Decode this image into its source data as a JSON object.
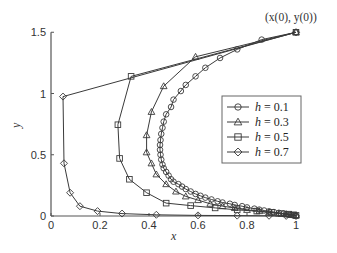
{
  "chart_data": {
    "type": "line",
    "title": "",
    "xlabel": "x",
    "ylabel": "y",
    "xlim": [
      0,
      1
    ],
    "ylim": [
      0,
      1.5
    ],
    "xticks": [
      0,
      0.2,
      0.4,
      0.6,
      0.8,
      1
    ],
    "xtick_labels": [
      "0",
      "0.2",
      "0.4",
      "0.6",
      "0.8",
      "1"
    ],
    "yticks": [
      0,
      0.5,
      1,
      1.5
    ],
    "ytick_labels": [
      "0",
      "0.5",
      "1",
      "1.5"
    ],
    "grid": false,
    "legend_position": "center-right",
    "annotation": {
      "text": "(x(0), y(0))",
      "x": 1,
      "y": 1.5
    },
    "series": [
      {
        "name": "h = 0.1",
        "label_var": "h",
        "label_val": "= 0.1",
        "marker": "circle",
        "x": [
          1,
          0.86,
          0.76,
          0.69,
          0.63,
          0.59,
          0.55,
          0.53,
          0.5,
          0.49,
          0.47,
          0.46,
          0.455,
          0.45,
          0.447,
          0.445,
          0.445,
          0.447,
          0.45,
          0.455,
          0.46,
          0.47,
          0.48,
          0.49,
          0.5,
          0.52,
          0.535,
          0.55,
          0.57,
          0.59,
          0.61,
          0.63,
          0.655,
          0.68,
          0.7,
          0.73,
          0.75,
          0.78,
          0.8,
          0.83,
          0.85,
          0.87,
          0.89,
          0.91,
          0.93,
          0.95,
          0.96,
          0.97,
          0.98,
          0.99,
          1
        ],
        "y": [
          1.5,
          1.44,
          1.36,
          1.29,
          1.21,
          1.14,
          1.07,
          1.02,
          0.95,
          0.89,
          0.83,
          0.77,
          0.72,
          0.67,
          0.62,
          0.58,
          0.54,
          0.5,
          0.46,
          0.42,
          0.39,
          0.36,
          0.33,
          0.3,
          0.28,
          0.26,
          0.24,
          0.22,
          0.2,
          0.18,
          0.165,
          0.15,
          0.135,
          0.12,
          0.11,
          0.1,
          0.09,
          0.08,
          0.07,
          0.06,
          0.052,
          0.045,
          0.038,
          0.032,
          0.026,
          0.02,
          0.016,
          0.012,
          0.009,
          0.005,
          0.002
        ]
      },
      {
        "name": "h = 0.3",
        "label_var": "h",
        "label_val": "= 0.3",
        "marker": "triangle",
        "x": [
          1,
          0.59,
          0.46,
          0.41,
          0.39,
          0.39,
          0.41,
          0.43,
          0.47,
          0.51,
          0.55,
          0.6,
          0.65,
          0.7,
          0.75,
          0.8,
          0.85,
          0.89,
          0.93,
          0.96,
          0.98,
          1
        ],
        "y": [
          1.5,
          1.3,
          1.06,
          0.85,
          0.66,
          0.52,
          0.43,
          0.34,
          0.26,
          0.2,
          0.16,
          0.13,
          0.1,
          0.08,
          0.065,
          0.05,
          0.04,
          0.03,
          0.02,
          0.015,
          0.01,
          0.005
        ]
      },
      {
        "name": "h = 0.5",
        "label_var": "h",
        "label_val": "= 0.5",
        "marker": "square",
        "x": [
          1,
          0.327,
          0.273,
          0.28,
          0.32,
          0.39,
          0.47,
          0.57,
          0.67,
          0.76,
          0.84,
          0.9,
          0.94,
          0.97,
          0.99,
          1
        ],
        "y": [
          1.5,
          1.14,
          0.745,
          0.47,
          0.3,
          0.19,
          0.105,
          0.085,
          0.066,
          0.05,
          0.04,
          0.03,
          0.02,
          0.015,
          0.01,
          0.005
        ]
      },
      {
        "name": "h = 0.7",
        "label_var": "h",
        "label_val": "= 0.7",
        "marker": "diamond",
        "x": [
          1,
          0.049,
          0.053,
          0.078,
          0.118,
          0.19,
          0.29,
          0.43,
          0.6,
          0.76,
          0.89,
          0.96,
          1
        ],
        "y": [
          1.5,
          0.975,
          0.43,
          0.19,
          0.08,
          0.04,
          0.02,
          0.01,
          0.005,
          0.003,
          0.002,
          0.001,
          0
        ]
      }
    ]
  },
  "colors": {
    "line": "#3a3a3a",
    "axis": "#555555",
    "legend_border": "#666666"
  }
}
